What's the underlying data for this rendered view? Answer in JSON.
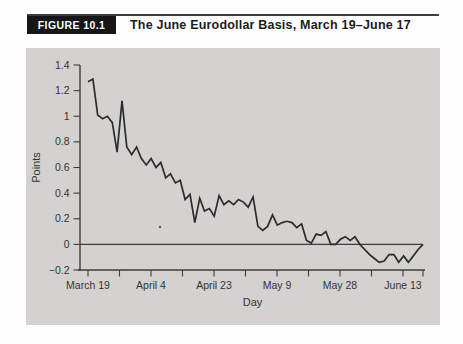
{
  "header": {
    "figure_label": "FIGURE 10.1",
    "title": "The June Eurodollar Basis, March 19–June 17"
  },
  "colors": {
    "page_bg": "#fefefe",
    "panel_bg": "#d3d2d0",
    "badge_bg": "#161616",
    "badge_text": "#ffffff",
    "title_text": "#1c1c1c",
    "axis": "#3c3c3c",
    "tick_text": "#333333",
    "line": "#2b2b2b"
  },
  "chart_data": {
    "type": "line",
    "title": "The June Eurodollar Basis, March 19–June 17",
    "xlabel": "Day",
    "ylabel": "Points",
    "x_tick_labels": [
      "March 19",
      "April 4",
      "April 23",
      "May 9",
      "May 28",
      "June 13"
    ],
    "y_ticks": [
      -0.2,
      0,
      0.2,
      0.4,
      0.6,
      0.8,
      1,
      1.2,
      1.4
    ],
    "y_tick_labels": [
      "−0.2",
      "0",
      "0.2",
      "0.4",
      "0.6",
      "0.8",
      "1",
      "1.2",
      "1.4"
    ],
    "ylim": [
      -0.2,
      1.4
    ],
    "x_range_days": [
      "March 19",
      "June 17"
    ],
    "grid": false,
    "legend": "none",
    "zero_line": true,
    "series": [
      {
        "name": "June Eurodollar basis (points)",
        "values": [
          1.27,
          1.29,
          1.01,
          0.98,
          1.0,
          0.95,
          0.72,
          1.12,
          0.76,
          0.7,
          0.76,
          0.67,
          0.62,
          0.67,
          0.6,
          0.64,
          0.52,
          0.55,
          0.48,
          0.5,
          0.35,
          0.39,
          0.17,
          0.36,
          0.26,
          0.28,
          0.22,
          0.38,
          0.31,
          0.34,
          0.31,
          0.35,
          0.33,
          0.29,
          0.37,
          0.14,
          0.11,
          0.14,
          0.23,
          0.15,
          0.17,
          0.18,
          0.17,
          0.13,
          0.16,
          0.03,
          0.01,
          0.08,
          0.07,
          0.1,
          0.0,
          0.0,
          0.04,
          0.06,
          0.03,
          0.06,
          0.0,
          -0.04,
          -0.08,
          -0.11,
          -0.14,
          -0.13,
          -0.08,
          -0.08,
          -0.14,
          -0.09,
          -0.14,
          -0.09,
          -0.04,
          0.0
        ]
      }
    ]
  }
}
